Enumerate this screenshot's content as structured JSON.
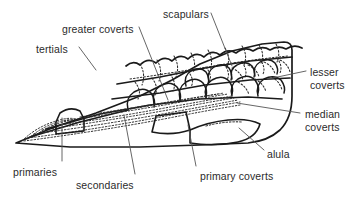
{
  "diagram": {
    "colors": {
      "background": "#ffffff",
      "outline": "#1a1a1a",
      "feather_detail": "#2b2b2b",
      "label_text": "#2b2b2b",
      "leader_line": "#555555"
    },
    "labels": [
      {
        "id": "tertials",
        "text": "tertials",
        "x": 36,
        "y": 43,
        "lines": 1
      },
      {
        "id": "greater-coverts",
        "text": "greater coverts",
        "x": 62,
        "y": 23,
        "lines": 1
      },
      {
        "id": "scapulars",
        "text": "scapulars",
        "x": 163,
        "y": 8,
        "lines": 1
      },
      {
        "id": "lesser-coverts",
        "text": "lesser\ncoverts",
        "x": 310,
        "y": 66,
        "lines": 2
      },
      {
        "id": "median-coverts",
        "text": "median\ncoverts",
        "x": 305,
        "y": 108,
        "lines": 2
      },
      {
        "id": "alula",
        "text": "alula",
        "x": 267,
        "y": 148,
        "lines": 1
      },
      {
        "id": "primary-coverts",
        "text": "primary coverts",
        "x": 200,
        "y": 170,
        "lines": 1
      },
      {
        "id": "secondaries",
        "text": "secondaries",
        "x": 76,
        "y": 179,
        "lines": 1
      },
      {
        "id": "primaries",
        "text": "primaries",
        "x": 13,
        "y": 166,
        "lines": 1
      }
    ],
    "leaders": [
      {
        "id": "leader-tertials",
        "from": [
          79,
          47
        ],
        "to": [
          96,
          70
        ]
      },
      {
        "id": "leader-greater-coverts",
        "from": [
          139,
          27
        ],
        "to": [
          168,
          100
        ]
      },
      {
        "id": "leader-scapulars",
        "from": [
          211,
          13
        ],
        "to": [
          232,
          66
        ]
      },
      {
        "id": "leader-lesser-coverts",
        "from": [
          306,
          71
        ],
        "to": [
          268,
          79
        ]
      },
      {
        "id": "leader-median-coverts",
        "from": [
          300,
          113
        ],
        "to": [
          237,
          103
        ]
      },
      {
        "id": "leader-alula",
        "from": [
          264,
          150
        ],
        "to": [
          239,
          128
        ]
      },
      {
        "id": "leader-primary-coverts",
        "from": [
          196,
          166
        ],
        "to": [
          188,
          125
        ]
      },
      {
        "id": "leader-secondaries",
        "from": [
          135,
          174
        ],
        "to": [
          124,
          115
        ]
      },
      {
        "id": "leader-primaries",
        "from": [
          62,
          161
        ],
        "to": [
          62,
          118
        ]
      }
    ],
    "feather_tracts": [
      "scapulars",
      "lesser coverts",
      "median coverts",
      "greater coverts",
      "tertials",
      "secondaries",
      "primaries",
      "primary coverts",
      "alula"
    ]
  }
}
